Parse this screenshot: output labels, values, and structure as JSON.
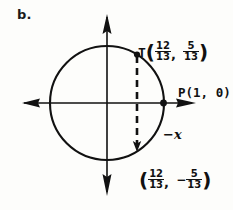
{
  "figure": {
    "letter": "b.",
    "colors": {
      "ink": "#111111",
      "background": "#fdfdfb"
    },
    "geometry": {
      "center_x": 107,
      "center_y": 103,
      "radius": 57,
      "chord_x": 137,
      "x_axis_left_tip": 22,
      "x_axis_right_tip": 196,
      "y_axis_top_tip": 14,
      "y_axis_bottom_tip": 196
    }
  },
  "labels": {
    "point_T": {
      "name": "T",
      "open_paren": "(",
      "x_numerator": "12",
      "x_denominator": "13",
      "comma": ",",
      "y_sign": "",
      "y_numerator": "5",
      "y_denominator": "13",
      "close_paren": ")"
    },
    "point_P": {
      "text": "P(1, 0)"
    },
    "axis_negative_x": {
      "text": "−x"
    },
    "point_bottom": {
      "open_paren": "(",
      "x_numerator": "12",
      "x_denominator": "13",
      "comma": ",",
      "y_sign": "−",
      "y_numerator": "5",
      "y_denominator": "13",
      "close_paren": ")"
    }
  }
}
